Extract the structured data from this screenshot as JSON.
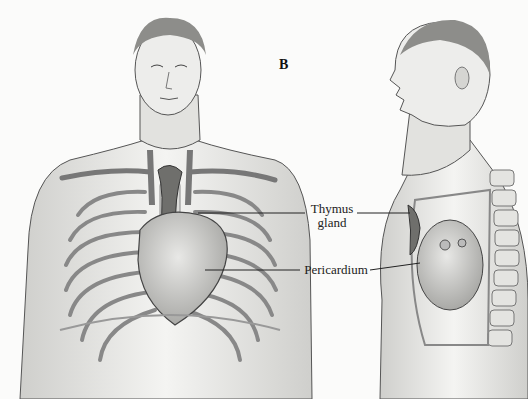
{
  "figure": {
    "panel_letter": "B",
    "labels": {
      "thymus_line1": "Thymus",
      "thymus_line2": "gland",
      "pericardium": "Pericardium"
    },
    "views": [
      "anterior-view",
      "lateral-view"
    ]
  }
}
